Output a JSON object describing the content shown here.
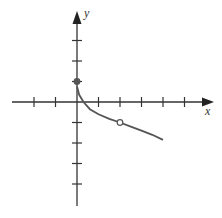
{
  "chart_data": {
    "type": "line",
    "title": "",
    "xlabel": "x",
    "ylabel": "y",
    "xlim": [
      -3.5,
      5
    ],
    "ylim": [
      -4.8,
      4.5
    ],
    "grid": false,
    "x_ticks": [
      -2,
      -1,
      1,
      2,
      3,
      4,
      5
    ],
    "y_ticks": [
      3,
      2,
      1,
      -1,
      -2,
      -3,
      -4
    ],
    "series": [
      {
        "name": "f(x)",
        "x": [
          0,
          0.1,
          0.3,
          0.6,
          1,
          1.5,
          2,
          2.5,
          3,
          3.5,
          4
        ],
        "y": [
          0.75,
          0.35,
          0.0,
          -0.35,
          -0.6,
          -0.82,
          -1.0,
          -1.2,
          -1.4,
          -1.6,
          -1.85
        ]
      }
    ],
    "points": [
      {
        "x": 0,
        "y": 1,
        "style": "filled"
      },
      {
        "x": 2,
        "y": -1,
        "style": "open"
      }
    ],
    "colors": {
      "curve": "#555555",
      "axes": "#333333"
    }
  },
  "labels": {
    "x": "x",
    "y": "y"
  }
}
